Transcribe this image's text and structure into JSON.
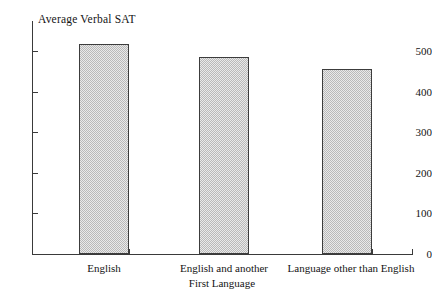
{
  "chart_data": {
    "type": "bar",
    "title": "Average Verbal SAT",
    "xlabel": "First Language",
    "ylabel": "",
    "categories": [
      "English",
      "English and another",
      "Language other than English"
    ],
    "values": [
      517,
      484,
      455
    ],
    "ylim": [
      0,
      560
    ],
    "yticks": [
      0,
      100,
      200,
      300,
      400,
      500
    ],
    "ytick_labels": [
      "0",
      "100",
      "200",
      "300",
      "400",
      "500"
    ],
    "grid": false,
    "legend": null,
    "bar_color": "#c9c9c9",
    "bar_edge_color": "#3c3c3c",
    "axis_color": "#3a3a3a",
    "background_color": "#ffffff"
  }
}
